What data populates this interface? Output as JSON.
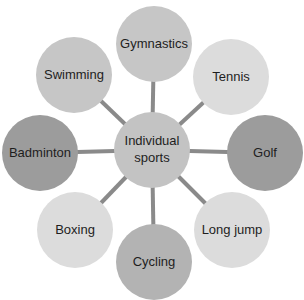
{
  "diagram": {
    "type": "hub-and-spoke",
    "line_color": "#8a8a8a",
    "center": {
      "label": "Individual sports",
      "lines": [
        "Individual",
        "sports"
      ],
      "x": 152,
      "y": 150,
      "r": 38,
      "color": "#c3c3c3"
    },
    "nodes": [
      {
        "label": "Gymnastics",
        "x": 154,
        "y": 44,
        "r": 38,
        "color": "#c6c6c6"
      },
      {
        "label": "Tennis",
        "x": 231,
        "y": 77,
        "r": 38,
        "color": "#dcdcdc"
      },
      {
        "label": "Golf",
        "x": 265,
        "y": 153,
        "r": 38,
        "color": "#9c9c9c"
      },
      {
        "label": "Long jump",
        "x": 232,
        "y": 230,
        "r": 38,
        "color": "#dcdcdc"
      },
      {
        "label": "Cycling",
        "x": 154,
        "y": 262,
        "r": 38,
        "color": "#b3b3b3"
      },
      {
        "label": "Boxing",
        "x": 75,
        "y": 230,
        "r": 38,
        "color": "#dcdcdc"
      },
      {
        "label": "Badminton",
        "x": 40,
        "y": 153,
        "r": 38,
        "color": "#9c9c9c"
      },
      {
        "label": "Swimming",
        "x": 74,
        "y": 75,
        "r": 38,
        "color": "#c6c6c6"
      }
    ]
  }
}
